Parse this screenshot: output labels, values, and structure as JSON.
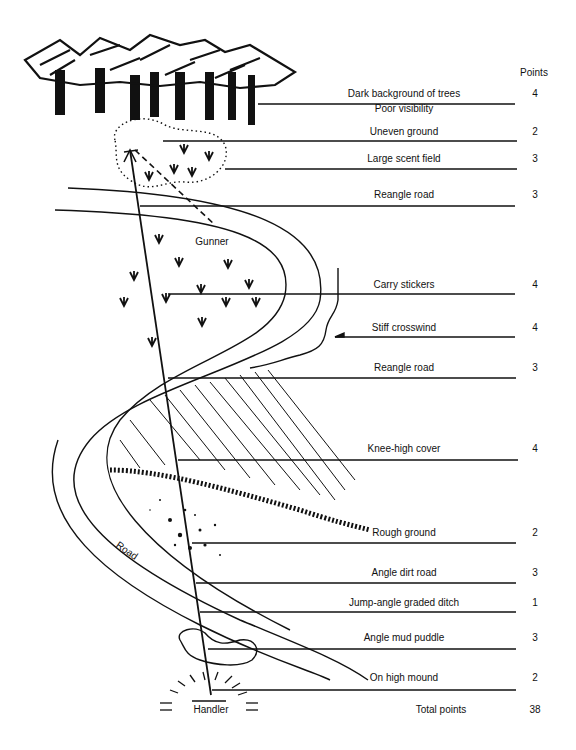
{
  "header": {
    "points_label": "Points"
  },
  "factors": [
    {
      "label": "Dark background of trees",
      "points": "4",
      "y": 96
    },
    {
      "label": "Poor visibility",
      "points": "",
      "y": 111
    },
    {
      "label": "Uneven ground",
      "points": "2",
      "y": 134
    },
    {
      "label": "Large scent field",
      "points": "3",
      "y": 161
    },
    {
      "label": "Reangle road",
      "points": "3",
      "y": 197
    },
    {
      "label": "Carry stickers",
      "points": "4",
      "y": 287
    },
    {
      "label": "Stiff crosswind",
      "points": "4",
      "y": 330
    },
    {
      "label": "Reangle road",
      "points": "3",
      "y": 370
    },
    {
      "label": "Knee-high cover",
      "points": "4",
      "y": 451
    },
    {
      "label": "Rough ground",
      "points": "2",
      "y": 535
    },
    {
      "label": "Angle dirt road",
      "points": "3",
      "y": 575
    },
    {
      "label": "Jump-angle graded ditch",
      "points": "1",
      "y": 605
    },
    {
      "label": "Angle mud puddle",
      "points": "3",
      "y": 640
    },
    {
      "label": "On high mound",
      "points": "2",
      "y": 680
    }
  ],
  "total": {
    "label": "Total points",
    "value": "38"
  },
  "map_labels": {
    "gunner": "Gunner",
    "handler": "Handler",
    "road": "Road"
  }
}
